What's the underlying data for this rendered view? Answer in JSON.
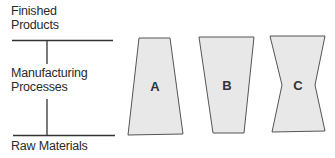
{
  "diagram": {
    "axis_labels": {
      "top": [
        "Finished",
        "Products"
      ],
      "middle": [
        "Manufacturing",
        "Processes"
      ],
      "bottom": [
        "Raw Materials"
      ]
    },
    "shapes": [
      {
        "id": "A",
        "label": "A",
        "description": "narrow top, wide bottom trapezoid"
      },
      {
        "id": "B",
        "label": "B",
        "description": "wide top, narrow bottom trapezoid"
      },
      {
        "id": "C",
        "label": "C",
        "description": "hourglass: wide top and bottom, narrow middle"
      }
    ],
    "colors": {
      "fill": "#e8e8e8",
      "stroke": "#444444",
      "line": "#333333"
    }
  }
}
